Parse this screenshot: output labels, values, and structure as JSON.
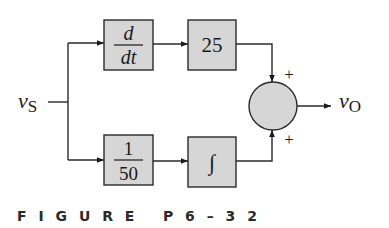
{
  "input": {
    "symbol": "v",
    "subscript": "S"
  },
  "output": {
    "symbol": "v",
    "subscript": "O"
  },
  "blocks": {
    "derivative": {
      "numerator": "d",
      "denominator": "dt"
    },
    "gain": {
      "label": "25"
    },
    "scale": {
      "numerator": "1",
      "denominator": "50"
    },
    "integrator": {
      "label": "∫"
    }
  },
  "summer": {
    "top_sign": "+",
    "bottom_sign": "+"
  },
  "caption": {
    "text": "F I G U R E   P 6 – 3 2"
  },
  "colors": {
    "block_fill": "#d6d6d6",
    "stroke": "#2a2a2a"
  }
}
